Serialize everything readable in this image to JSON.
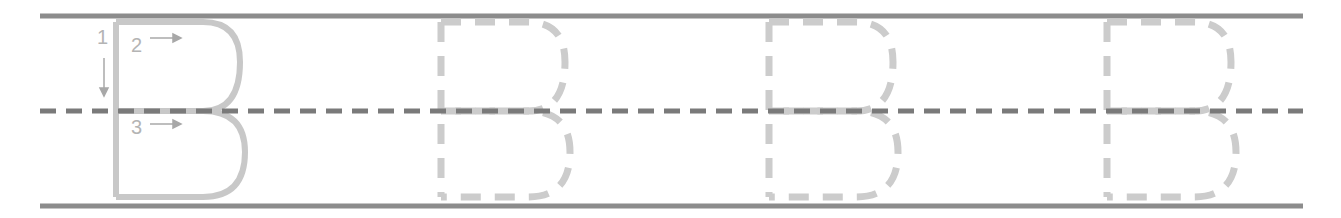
{
  "worksheet": {
    "letter": "B",
    "guide_letter_count": 1,
    "practice_letter_count": 3,
    "stroke_numbers": [
      "1",
      "2",
      "3"
    ],
    "colors": {
      "ruled_line": "#8c8c8c",
      "midline": "#7a7a7a",
      "guide_letter": "#c8c8c8",
      "trace_dashes": "#cccccc",
      "stroke_number": "#b4b4b4"
    }
  }
}
